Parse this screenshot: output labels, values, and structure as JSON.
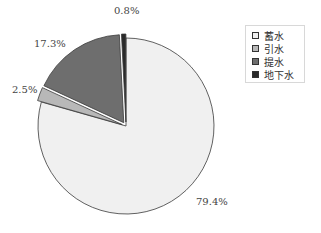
{
  "chart_data": {
    "type": "pie",
    "title": "",
    "categories": [
      "蓄水",
      "引水",
      "提水",
      "地下水"
    ],
    "values": [
      79.4,
      2.5,
      17.3,
      0.8
    ],
    "unit": "%",
    "labels": [
      "79.4%",
      "2.5%",
      "17.3%",
      "0.8%"
    ],
    "colors": [
      "#f0f0f0",
      "#b8b8b8",
      "#6e6e6e",
      "#2a2a2a"
    ],
    "exploded": [
      false,
      true,
      true,
      true
    ],
    "start_angle_deg": 0,
    "direction": "clockwise",
    "legend_position": "right",
    "grid": false
  },
  "legend": {
    "items": [
      {
        "label": "蓄水",
        "color": "#f0f0f0"
      },
      {
        "label": "引水",
        "color": "#b8b8b8"
      },
      {
        "label": "提水",
        "color": "#6e6e6e"
      },
      {
        "label": "地下水",
        "color": "#2a2a2a"
      }
    ]
  }
}
